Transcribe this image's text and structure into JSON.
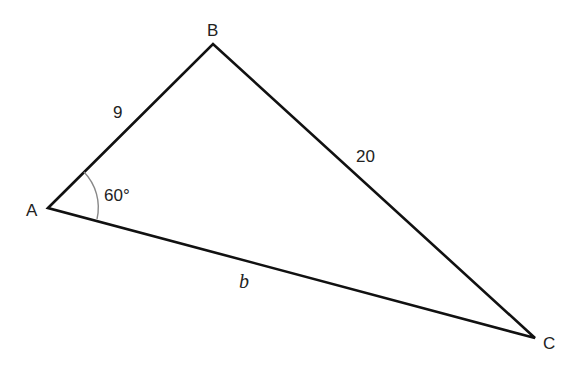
{
  "diagram": {
    "type": "triangle",
    "vertices": [
      {
        "label": "A",
        "x": 48,
        "y": 208
      },
      {
        "label": "B",
        "x": 213,
        "y": 44
      },
      {
        "label": "C",
        "x": 535,
        "y": 338
      }
    ],
    "sides": [
      {
        "between": "AB",
        "label": "9"
      },
      {
        "between": "BC",
        "label": "20"
      },
      {
        "between": "AC",
        "label": "b"
      }
    ],
    "angles": [
      {
        "vertex": "A",
        "label": "60°"
      }
    ],
    "colors": {
      "stroke": "#111111",
      "arc": "#888888",
      "text": "#222222"
    }
  }
}
